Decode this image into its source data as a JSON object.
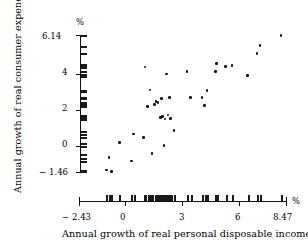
{
  "chart_data": {
    "type": "scatter",
    "title": "",
    "xlabel": "Annual growth of real personal disposable income",
    "ylabel": "Annual growth of real consumer expenditure",
    "x_unit": "%",
    "y_unit": "%",
    "xlim": [
      -2.43,
      8.47
    ],
    "ylim": [
      -1.46,
      6.14
    ],
    "xticks": [
      -2.43,
      0,
      3,
      6,
      8.47
    ],
    "xtick_labels": [
      "− 2.43",
      "0",
      "3",
      "6",
      "8.47"
    ],
    "yticks": [
      -1.46,
      0,
      2,
      4,
      6.14
    ],
    "ytick_labels": [
      "− 1.46",
      "0",
      "2",
      "4",
      "6.14"
    ],
    "grid": false,
    "legend": false,
    "marker": "filled-circle",
    "marker_color": "#0d0d0d",
    "axis_color": "#111111",
    "background": "#ffffff",
    "rug_x": true,
    "rug_y": true,
    "points": [
      {
        "x": -0.99,
        "y": -1.35
      },
      {
        "x": -0.86,
        "y": -0.66
      },
      {
        "x": -0.72,
        "y": -1.42
      },
      {
        "x": -0.3,
        "y": 0.16
      },
      {
        "x": 0.32,
        "y": -0.86
      },
      {
        "x": 0.45,
        "y": 0.65
      },
      {
        "x": 0.98,
        "y": 0.47
      },
      {
        "x": 1.05,
        "y": 4.37
      },
      {
        "x": 1.18,
        "y": 2.18
      },
      {
        "x": 1.3,
        "y": 3.1
      },
      {
        "x": 1.42,
        "y": -0.45
      },
      {
        "x": 1.55,
        "y": 2.3
      },
      {
        "x": 1.62,
        "y": 2.45
      },
      {
        "x": 1.74,
        "y": 2.38
      },
      {
        "x": 1.86,
        "y": 1.55
      },
      {
        "x": 1.92,
        "y": 2.62
      },
      {
        "x": 1.98,
        "y": 1.62
      },
      {
        "x": 2.05,
        "y": 0.0
      },
      {
        "x": 2.1,
        "y": 1.48
      },
      {
        "x": 2.18,
        "y": 3.97
      },
      {
        "x": 2.25,
        "y": 1.7
      },
      {
        "x": 2.33,
        "y": 2.68
      },
      {
        "x": 2.4,
        "y": 1.52
      },
      {
        "x": 2.58,
        "y": 0.83
      },
      {
        "x": 3.25,
        "y": 4.12
      },
      {
        "x": 3.45,
        "y": 2.66
      },
      {
        "x": 4.05,
        "y": 2.68
      },
      {
        "x": 4.18,
        "y": 2.22
      },
      {
        "x": 4.3,
        "y": 3.05
      },
      {
        "x": 4.75,
        "y": 4.12
      },
      {
        "x": 4.82,
        "y": 4.55
      },
      {
        "x": 5.3,
        "y": 4.38
      },
      {
        "x": 5.62,
        "y": 4.45
      },
      {
        "x": 6.45,
        "y": 3.88
      },
      {
        "x": 6.95,
        "y": 5.12
      },
      {
        "x": 7.1,
        "y": 5.55
      },
      {
        "x": 8.2,
        "y": 6.12
      }
    ],
    "rug_x_values": [
      -0.99,
      -0.86,
      -0.72,
      -0.3,
      0.32,
      0.45,
      0.98,
      1.05,
      1.18,
      1.3,
      1.42,
      1.55,
      1.62,
      1.74,
      1.86,
      1.92,
      1.98,
      2.05,
      2.1,
      2.18,
      2.25,
      2.33,
      2.4,
      2.58,
      3.25,
      3.45,
      4.05,
      4.18,
      4.3,
      4.75,
      4.82,
      5.3,
      5.62,
      6.45,
      6.95,
      7.1,
      8.2
    ],
    "rug_y_values": [
      -1.42,
      -1.35,
      -0.86,
      -0.66,
      -0.45,
      0.0,
      0.16,
      0.47,
      0.65,
      0.83,
      1.48,
      1.52,
      1.55,
      1.62,
      1.7,
      2.18,
      2.22,
      2.3,
      2.38,
      2.45,
      2.62,
      2.66,
      2.68,
      2.68,
      3.05,
      3.1,
      3.88,
      3.97,
      4.12,
      4.12,
      4.37,
      4.38,
      4.45,
      4.55,
      5.12,
      5.55,
      6.12
    ]
  }
}
